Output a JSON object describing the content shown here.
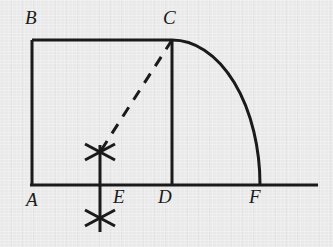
{
  "figure": {
    "kind": "geometry-construction-diagram",
    "background_color": "#e9e9e9",
    "ink_color": "#1a1a1a",
    "stroke_width": 3,
    "labels": [
      {
        "id": "B",
        "text": "B",
        "x": 25,
        "y": 8,
        "point_x": 32,
        "point_y": 40
      },
      {
        "id": "C",
        "text": "C",
        "x": 163,
        "y": 8,
        "point_x": 172,
        "point_y": 40
      },
      {
        "id": "A",
        "text": "A",
        "x": 26,
        "y": 190,
        "point_x": 32,
        "point_y": 185
      },
      {
        "id": "E",
        "text": "E",
        "x": 113,
        "y": 187,
        "point_x": 100,
        "point_y": 185
      },
      {
        "id": "D",
        "text": "D",
        "x": 158,
        "y": 187,
        "point_x": 172,
        "point_y": 185
      },
      {
        "id": "F",
        "text": "F",
        "x": 249,
        "y": 187,
        "point_x": 260,
        "point_y": 185
      }
    ],
    "geometry": {
      "baseline": {
        "x1": 30,
        "y1": 185,
        "x2": 318,
        "y2": 185
      },
      "square": {
        "A": {
          "x": 32,
          "y": 185
        },
        "B": {
          "x": 32,
          "y": 40
        },
        "C": {
          "x": 172,
          "y": 40
        },
        "D": {
          "x": 172,
          "y": 185
        },
        "side_left": {
          "x1": 32,
          "y1": 40,
          "x2": 32,
          "y2": 185
        },
        "side_top": {
          "x1": 32,
          "y1": 40,
          "x2": 172,
          "y2": 40
        },
        "side_right": {
          "x1": 172,
          "y1": 40,
          "x2": 172,
          "y2": 185
        }
      },
      "arc": {
        "center_x": 172,
        "center_y": 185,
        "radius": 145,
        "start_x": 172,
        "start_y": 40,
        "end_x": 260,
        "end_y": 185,
        "sweep": "quarter-circle-clockwise"
      },
      "dashed_segment": {
        "x1": 172,
        "y1": 40,
        "x2": 100,
        "y2": 152,
        "dash": "11 9"
      },
      "construction_line": {
        "x": 100,
        "y1": 145,
        "y2": 232
      },
      "arc_crosses": [
        {
          "id": "upper-cross",
          "x": 100,
          "y": 152
        },
        {
          "id": "lower-cross",
          "x": 100,
          "y": 218
        }
      ]
    }
  }
}
